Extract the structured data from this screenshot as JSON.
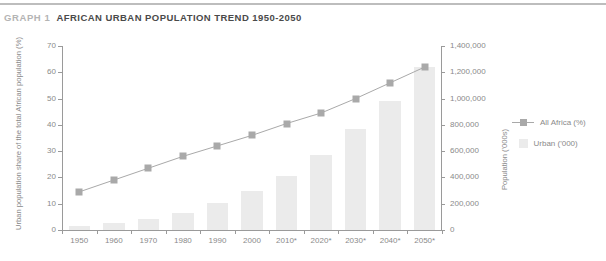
{
  "header": {
    "kicker": "GRAPH 1",
    "title": "AFRICAN URBAN POPULATION TREND 1950-2050"
  },
  "legend": {
    "position": "right",
    "items": [
      {
        "label": "All Africa (%)",
        "key": "line-marker",
        "color": "#a9a9a9"
      },
      {
        "label": "Urban ('000)",
        "key": "bar-swatch",
        "color": "#ebebeb"
      }
    ]
  },
  "colors": {
    "bar": "#ebebeb",
    "line": "#a9a9a9",
    "marker": "#a9a9a9",
    "axis": "#9a9a9a",
    "tick_label": "#8a8a8a",
    "title": "#4a4a4a",
    "kicker": "#b4b4b4",
    "rule": "#bdbdbd"
  },
  "chart_data": {
    "type": "bar",
    "title": "AFRICAN URBAN POPULATION TREND 1950-2050",
    "xlabel": "",
    "ylabel": "Urban population share of the total African population (%)",
    "y2label": "Population ('000s)",
    "categories": [
      "1950",
      "1960",
      "1970",
      "1980",
      "1990",
      "2000",
      "2010*",
      "2020*",
      "2030*",
      "2040*",
      "2050*"
    ],
    "grid": false,
    "ylim": [
      0,
      70
    ],
    "yticks": [
      0,
      10,
      20,
      30,
      40,
      50,
      60,
      70
    ],
    "ytick_labels": [
      "0",
      "10",
      "20",
      "30",
      "40",
      "50",
      "60",
      "70"
    ],
    "y2lim": [
      0,
      1400000
    ],
    "y2ticks": [
      0,
      200000,
      400000,
      600000,
      800000,
      1000000,
      1200000,
      1400000
    ],
    "y2tick_labels": [
      "0",
      "200,000",
      "400,000",
      "600,000",
      "800,000",
      "1,000,000",
      "1,200,000",
      "1,400,000"
    ],
    "series": [
      {
        "name": "Urban ('000)",
        "type": "bar",
        "axis": "y2",
        "values": [
          33000,
          50000,
          83000,
          130000,
          206000,
          295000,
          410000,
          570000,
          765000,
          985000,
          1240000
        ]
      },
      {
        "name": "All Africa (%)",
        "type": "line",
        "axis": "y1",
        "values": [
          14.5,
          19,
          23.5,
          28,
          32,
          36,
          40.5,
          44.5,
          50,
          56,
          62
        ]
      }
    ]
  }
}
